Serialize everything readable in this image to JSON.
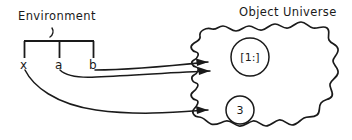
{
  "diagram": {
    "title_left": "Environment",
    "title_right": "Object Universe",
    "variables": [
      {
        "name": "x",
        "label": "x"
      },
      {
        "name": "a",
        "label": "a"
      },
      {
        "name": "b",
        "label": "b"
      }
    ],
    "objects": [
      {
        "id": "list-object",
        "label": "[1:]"
      },
      {
        "id": "int-object",
        "label": "3"
      }
    ],
    "bindings": [
      {
        "from": "b",
        "to": "[1:]"
      },
      {
        "from": "a",
        "to": "[1:]"
      },
      {
        "from": "x",
        "to": "3"
      }
    ],
    "colors": {
      "ink": "#1a1a1a",
      "background": "#ffffff"
    }
  }
}
